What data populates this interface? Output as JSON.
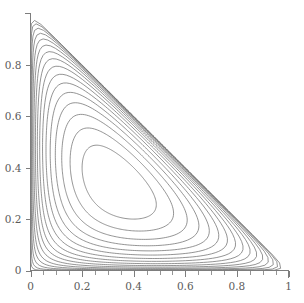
{
  "figure": {
    "title": "",
    "background_color": "#ffffff",
    "line_color": "#6a6a6a",
    "axis_color": "#7d7d7d",
    "label_color": "#5b5b5b"
  },
  "chart_data": {
    "type": "line",
    "subtype": "contour",
    "title": "",
    "subtitle": "",
    "xlabel": "",
    "ylabel": "",
    "xlim": [
      0,
      1
    ],
    "ylim": [
      0,
      1
    ],
    "grid": false,
    "legend": false,
    "legend_position": "none",
    "domain_note": "triangular simplex region x >= 0, y >= 0, x + y <= 1",
    "x_ticks_major": [
      0,
      0.2,
      0.4,
      0.6,
      0.8,
      1
    ],
    "x_tick_labels": [
      "0",
      "0.2",
      "0.4",
      "0.6",
      "0.8",
      "1"
    ],
    "y_ticks_major": [
      0,
      0.2,
      0.4,
      0.6,
      0.8
    ],
    "y_tick_labels": [
      "0",
      "0.2",
      "0.4",
      "0.6",
      "0.8"
    ],
    "minor_tick_step": 0.05,
    "x_minor_ticks": [
      0.05,
      0.1,
      0.15,
      0.25,
      0.3,
      0.35,
      0.45,
      0.5,
      0.55,
      0.65,
      0.7,
      0.75,
      0.85,
      0.9,
      0.95
    ],
    "y_minor_ticks": [],
    "contour_count": 16,
    "contour_center": [
      0.313,
      0.333
    ],
    "contour_center_label": "maximum",
    "contour_levels": [
      0.002,
      0.0057,
      0.0094,
      0.0131,
      0.0167,
      0.0204,
      0.0241,
      0.0278,
      0.0315,
      0.0352,
      0.0389,
      0.0426,
      0.0463,
      0.05,
      0.0537,
      0.0574
    ],
    "field_expression": "x * y * (1 - x - y)",
    "field_max_value": 0.037,
    "outer_contour_extent": {
      "x_max": 0.915,
      "y_max": 0.915,
      "x_min": 0.022,
      "y_min": 0.022
    }
  },
  "axes": {
    "x_axis_name": "x-axis",
    "y_axis_name": "y-axis",
    "x_axis_range_label": "0 to 1",
    "y_axis_range_label": "0 to 1"
  }
}
